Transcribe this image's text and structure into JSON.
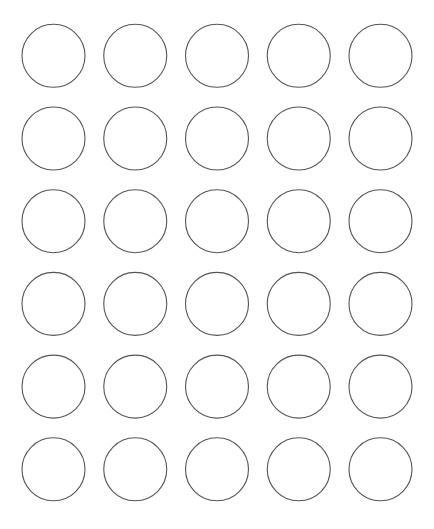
{
  "grid": {
    "rows": 6,
    "columns": 5,
    "shape": "circle",
    "fill_color": "#ffffff",
    "stroke_color": "#555555",
    "background_color": "#ffffff"
  }
}
